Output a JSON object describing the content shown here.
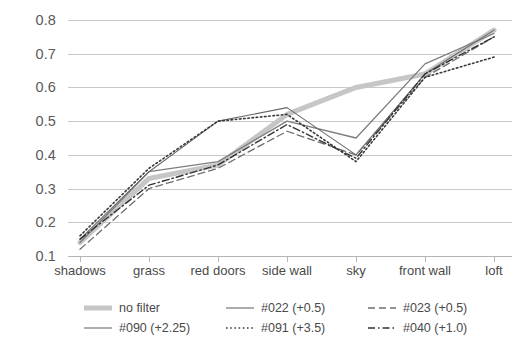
{
  "chart_data": {
    "type": "line",
    "title": "",
    "xlabel": "",
    "ylabel": "",
    "categories": [
      "shadows",
      "grass",
      "red doors",
      "side wall",
      "sky",
      "front wall",
      "loft"
    ],
    "ylim": [
      0.1,
      0.8
    ],
    "yticks": [
      0.1,
      0.2,
      0.3,
      0.4,
      0.5,
      0.6,
      0.7,
      0.8
    ],
    "ytick_labels": [
      "0.1",
      "0.2",
      "0.3",
      "0.4",
      "0.5",
      "0.6",
      "0.7",
      "0.8"
    ],
    "grid": "horizontal",
    "legend_position": "bottom",
    "series": [
      {
        "name": "no filter",
        "style": "solid-thick",
        "color": "#c6c6c6",
        "width": 5,
        "dash": "",
        "values": [
          0.14,
          0.33,
          0.37,
          0.52,
          0.6,
          0.64,
          0.77
        ]
      },
      {
        "name": "#022 (+0.5)",
        "style": "solid",
        "color": "#7d7d7d",
        "width": 1.3,
        "dash": "",
        "values": [
          0.14,
          0.35,
          0.38,
          0.5,
          0.45,
          0.67,
          0.76
        ]
      },
      {
        "name": "#023 (+0.5)",
        "style": "dashed",
        "color": "#6e6e6e",
        "width": 1.3,
        "dash": "7,4",
        "values": [
          0.12,
          0.3,
          0.36,
          0.47,
          0.4,
          0.63,
          0.75
        ]
      },
      {
        "name": "#090 (+2.25)",
        "style": "solid",
        "color": "#6a6a6a",
        "width": 1.1,
        "dash": "",
        "values": [
          0.15,
          0.35,
          0.5,
          0.54,
          0.4,
          0.64,
          0.77
        ]
      },
      {
        "name": "#091 (+3.5)",
        "style": "dotted",
        "color": "#3a3a3a",
        "width": 1.6,
        "dash": "1.6,2.6",
        "values": [
          0.16,
          0.36,
          0.5,
          0.52,
          0.38,
          0.63,
          0.69
        ]
      },
      {
        "name": "#040 (+1.0)",
        "style": "dash-dot",
        "color": "#333333",
        "width": 1.4,
        "dash": "7,3,1.5,3",
        "values": [
          0.15,
          0.31,
          0.37,
          0.49,
          0.39,
          0.64,
          0.75
        ]
      }
    ]
  },
  "axes": {
    "y_tick_labels": [
      "0.8",
      "0.7",
      "0.6",
      "0.5",
      "0.4",
      "0.3",
      "0.2",
      "0.1"
    ],
    "x_tick_labels": [
      "shadows",
      "grass",
      "red doors",
      "side wall",
      "sky",
      "front wall",
      "loft"
    ]
  },
  "legend": {
    "items": [
      {
        "label": "no filter",
        "icon": "thick-line-swatch-icon"
      },
      {
        "label": "#022 (+0.5)",
        "icon": "solid-line-swatch-icon"
      },
      {
        "label": "#023 (+0.5)",
        "icon": "dashed-line-swatch-icon"
      },
      {
        "label": "#090 (+2.25)",
        "icon": "solid-line-swatch-icon"
      },
      {
        "label": "#091 (+3.5)",
        "icon": "dotted-line-swatch-icon"
      },
      {
        "label": "#040 (+1.0)",
        "icon": "dash-dot-line-swatch-icon"
      }
    ]
  }
}
